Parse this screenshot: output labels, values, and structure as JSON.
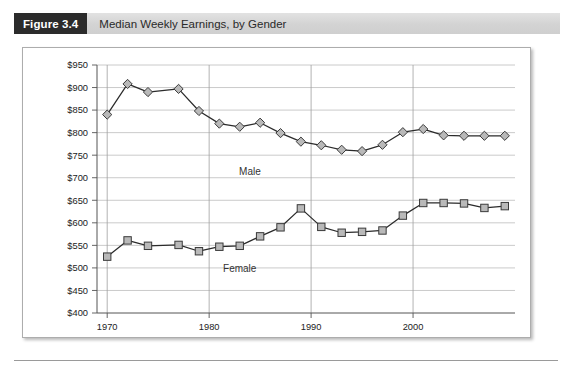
{
  "figure": {
    "tag": "Figure 3.4",
    "caption": "Median Weekly Earnings, by Gender"
  },
  "chart_data": {
    "type": "line",
    "title": "Median Weekly Earnings, by Gender",
    "xlabel": "",
    "ylabel": "",
    "xlim": [
      1969,
      2010
    ],
    "ylim": [
      400,
      950
    ],
    "ytick_labels": [
      "$400",
      "$450",
      "$500",
      "$550",
      "$600",
      "$650",
      "$700",
      "$750",
      "$800",
      "$850",
      "$900",
      "$950"
    ],
    "ytick_values": [
      400,
      450,
      500,
      550,
      600,
      650,
      700,
      750,
      800,
      850,
      900,
      950
    ],
    "xtick_labels": [
      "1970",
      "1980",
      "1990",
      "2000"
    ],
    "xtick_values": [
      1970,
      1980,
      1990,
      2000
    ],
    "grid": true,
    "legend_position": "inline-annotation",
    "x": [
      1970,
      1972,
      1975,
      1977,
      1979,
      1981,
      1983,
      1985,
      1987,
      1989,
      1990,
      1992,
      1994,
      1996,
      1998,
      2000,
      2002,
      2004,
      2006,
      2008
    ],
    "series": [
      {
        "name": "Male",
        "marker": "diamond",
        "marker_fill": "#b9b9b9",
        "marker_stroke": "#3a3a3a",
        "line_color": "#2b2b2b",
        "x": [
          1970,
          1972,
          1974,
          1977,
          1979,
          1981,
          1983,
          1985,
          1987,
          1989,
          1991,
          1993,
          1995,
          1997,
          1999,
          2001,
          2003,
          2005,
          2007,
          2009
        ],
        "values": [
          840,
          908,
          890,
          897,
          848,
          820,
          813,
          822,
          799,
          780,
          772,
          762,
          759,
          773,
          801,
          808,
          794,
          793,
          793,
          793
        ]
      },
      {
        "name": "Female",
        "marker": "square",
        "marker_fill": "#b9b9b9",
        "marker_stroke": "#3a3a3a",
        "line_color": "#2b2b2b",
        "x": [
          1970,
          1972,
          1974,
          1977,
          1979,
          1981,
          1983,
          1985,
          1987,
          1989,
          1991,
          1993,
          1995,
          1997,
          1999,
          2001,
          2003,
          2005,
          2007,
          2009
        ],
        "values": [
          525,
          561,
          549,
          551,
          537,
          547,
          549,
          570,
          590,
          632,
          591,
          578,
          580,
          583,
          616,
          644,
          644,
          643,
          633,
          637
        ]
      }
    ],
    "annotations": [
      {
        "text": "Male",
        "x": 1984,
        "y": 707
      },
      {
        "text": "Female",
        "x": 1983,
        "y": 492
      }
    ]
  }
}
